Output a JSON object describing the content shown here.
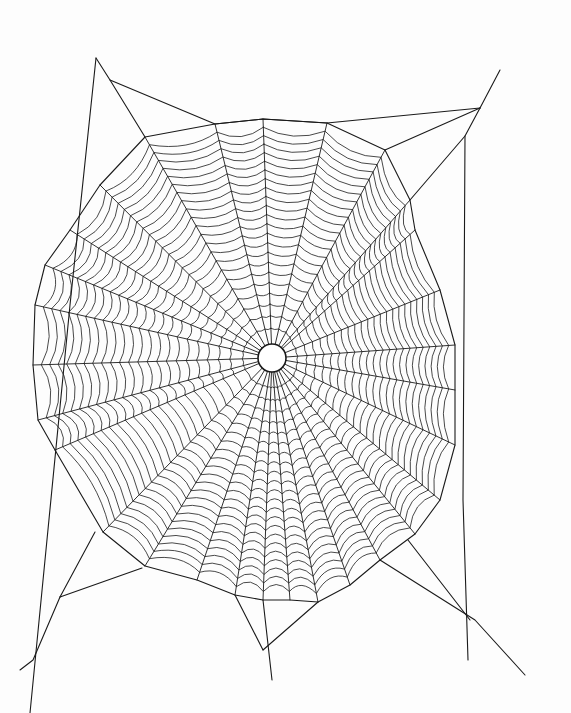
{
  "artwork": {
    "subject": "Spider web line drawing",
    "background": "#fdfdfd",
    "ink": "#1a1a1a",
    "hub": {
      "cx": 272,
      "cy": 358,
      "r": 14
    },
    "spoke_count": 26,
    "spiral_rings": 22,
    "outer_polygon": [
      [
        263,
        119
      ],
      [
        215,
        124
      ],
      [
        145,
        137
      ],
      [
        100,
        185
      ],
      [
        70,
        230
      ],
      [
        45,
        265
      ],
      [
        35,
        305
      ],
      [
        33,
        365
      ],
      [
        38,
        420
      ],
      [
        55,
        450
      ],
      [
        103,
        532
      ],
      [
        145,
        566
      ],
      [
        197,
        580
      ],
      [
        235,
        595
      ],
      [
        263,
        600
      ],
      [
        290,
        600
      ],
      [
        318,
        602
      ],
      [
        350,
        585
      ],
      [
        380,
        560
      ],
      [
        415,
        534
      ],
      [
        440,
        500
      ],
      [
        455,
        445
      ],
      [
        455,
        390
      ],
      [
        455,
        345
      ],
      [
        440,
        290
      ],
      [
        415,
        230
      ],
      [
        410,
        200
      ],
      [
        385,
        150
      ],
      [
        327,
        123
      ]
    ],
    "frame_lines": [
      [
        [
          96,
          58
        ],
        [
          110,
          80
        ],
        [
          145,
          137
        ]
      ],
      [
        [
          96,
          58
        ],
        [
          70,
          305
        ],
        [
          30,
          713
        ]
      ],
      [
        [
          110,
          80
        ],
        [
          215,
          124
        ],
        [
          263,
          119
        ],
        [
          327,
          123
        ],
        [
          480,
          108
        ]
      ],
      [
        [
          480,
          108
        ],
        [
          500,
          70
        ]
      ],
      [
        [
          480,
          108
        ],
        [
          385,
          150
        ]
      ],
      [
        [
          480,
          108
        ],
        [
          465,
          136
        ],
        [
          463,
          500
        ],
        [
          468,
          660
        ]
      ],
      [
        [
          465,
          136
        ],
        [
          410,
          200
        ]
      ],
      [
        [
          60,
          597
        ],
        [
          142,
          568
        ]
      ],
      [
        [
          60,
          597
        ],
        [
          33,
          660
        ],
        [
          20,
          670
        ]
      ],
      [
        [
          60,
          597
        ],
        [
          95,
          532
        ]
      ],
      [
        [
          263,
          600
        ],
        [
          272,
          680
        ]
      ],
      [
        [
          235,
          595
        ],
        [
          263,
          650
        ]
      ],
      [
        [
          318,
          602
        ],
        [
          263,
          650
        ]
      ],
      [
        [
          380,
          560
        ],
        [
          475,
          620
        ],
        [
          525,
          675
        ]
      ],
      [
        [
          408,
          540
        ],
        [
          470,
          620
        ]
      ]
    ]
  }
}
